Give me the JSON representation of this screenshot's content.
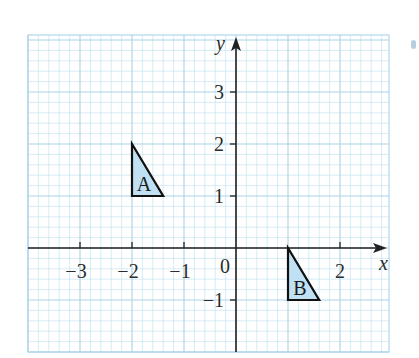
{
  "chart_data": {
    "type": "coordinate-grid",
    "title": "",
    "xlabel": "x",
    "ylabel": "y",
    "xlim": [
      -4,
      3
    ],
    "ylim": [
      -2,
      4
    ],
    "grid": true,
    "minor_divisions_per_unit": 5,
    "x_tick_labels": [
      "−3",
      "−2",
      "−1",
      "2"
    ],
    "x_tick_values": [
      -3,
      -2,
      -1,
      2
    ],
    "y_tick_labels": [
      "3",
      "2",
      "1",
      "−1"
    ],
    "y_tick_values": [
      3,
      2,
      1,
      -1
    ],
    "origin_label": "0",
    "shapes": [
      {
        "label": "A",
        "type": "triangle",
        "vertices": [
          [
            -2,
            2
          ],
          [
            -2,
            1
          ],
          [
            -1.4,
            1
          ]
        ]
      },
      {
        "label": "B",
        "type": "triangle",
        "vertices": [
          [
            1,
            0
          ],
          [
            1,
            -1
          ],
          [
            1.6,
            -1
          ]
        ]
      }
    ]
  },
  "colors": {
    "grid_minor": "#cde6f2",
    "grid_major": "#a9d3ea",
    "axis": "#222222",
    "shape_fill": "#bfe1f3",
    "shape_stroke": "#111111"
  }
}
